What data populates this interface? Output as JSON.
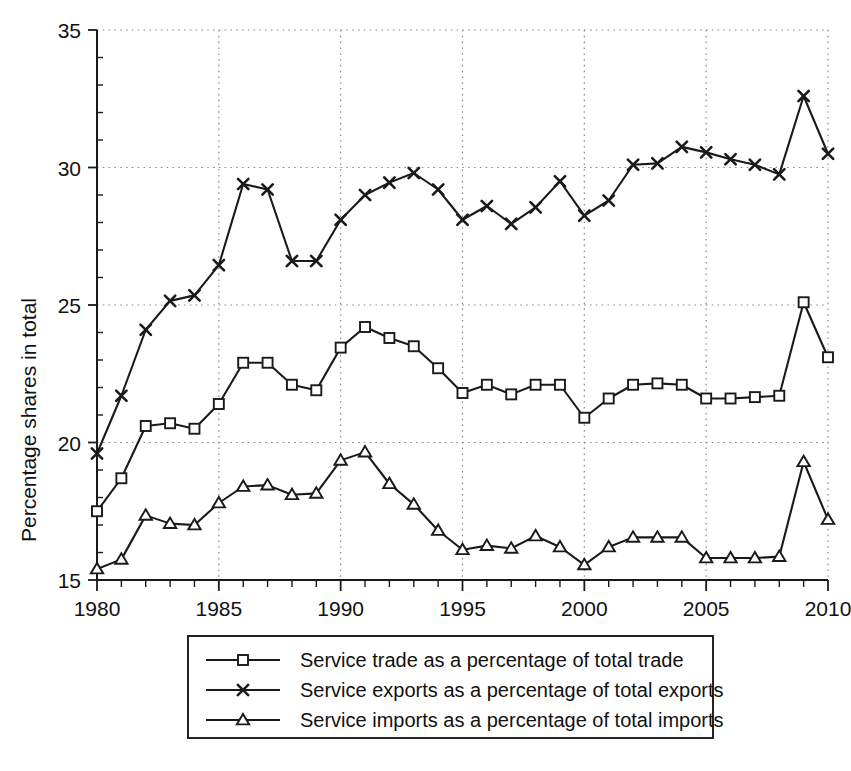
{
  "chart_data": {
    "type": "line",
    "title": "",
    "xlabel": "",
    "ylabel": "Percentage shares in total",
    "xlim": [
      1980,
      2010
    ],
    "ylim": [
      15,
      35
    ],
    "grid": true,
    "legend_position": "below-center",
    "x_ticks": [
      "1980",
      "1985",
      "1990",
      "1995",
      "2000",
      "2005",
      "2010"
    ],
    "x_tick_values": [
      1980,
      1985,
      1990,
      1995,
      2000,
      2005,
      2010
    ],
    "y_ticks": [
      "15",
      "20",
      "25",
      "30",
      "35"
    ],
    "y_tick_values": [
      15,
      20,
      25,
      30,
      35
    ],
    "x": [
      1980,
      1981,
      1982,
      1983,
      1984,
      1985,
      1986,
      1987,
      1988,
      1989,
      1990,
      1991,
      1992,
      1993,
      1994,
      1995,
      1996,
      1997,
      1998,
      1999,
      2000,
      2001,
      2002,
      2003,
      2004,
      2005,
      2006,
      2007,
      2008,
      2009,
      2010
    ],
    "series": [
      {
        "name": "Service trade as a percentage of total trade",
        "marker": "square",
        "values": [
          17.5,
          18.7,
          20.6,
          20.7,
          20.5,
          21.4,
          22.9,
          22.9,
          22.1,
          21.9,
          23.45,
          24.2,
          23.8,
          23.5,
          22.7,
          21.8,
          22.1,
          21.75,
          22.1,
          22.1,
          20.9,
          21.6,
          22.1,
          22.15,
          22.1,
          21.6,
          21.6,
          21.65,
          21.7,
          25.1,
          23.1
        ]
      },
      {
        "name": "Service exports as a percentage of total exports",
        "marker": "cross",
        "values": [
          19.6,
          21.7,
          24.1,
          25.15,
          25.35,
          26.45,
          29.4,
          29.2,
          26.6,
          26.6,
          28.1,
          29.0,
          29.45,
          29.8,
          29.2,
          28.1,
          28.6,
          27.95,
          28.55,
          29.5,
          28.25,
          28.8,
          30.1,
          30.15,
          30.75,
          30.55,
          30.3,
          30.1,
          29.75,
          32.6,
          30.5
        ]
      },
      {
        "name": "Service imports as a percentage of total imports",
        "marker": "triangle",
        "values": [
          15.4,
          15.75,
          17.35,
          17.05,
          17.0,
          17.8,
          18.4,
          18.45,
          18.1,
          18.15,
          19.35,
          19.65,
          18.5,
          17.75,
          16.8,
          16.1,
          16.25,
          16.15,
          16.6,
          16.2,
          15.55,
          16.2,
          16.55,
          16.55,
          16.55,
          15.8,
          15.8,
          15.8,
          15.85,
          19.3,
          17.2
        ]
      }
    ]
  },
  "legend": {
    "items": [
      {
        "label": "Service trade as a percentage of total trade",
        "marker": "square"
      },
      {
        "label": "Service exports as a percentage of total exports",
        "marker": "cross"
      },
      {
        "label": "Service imports as a percentage of total imports",
        "marker": "triangle"
      }
    ]
  },
  "colors": {
    "line": "#1a1a1a",
    "grid": "#8a8a8a",
    "background": "#ffffff"
  }
}
